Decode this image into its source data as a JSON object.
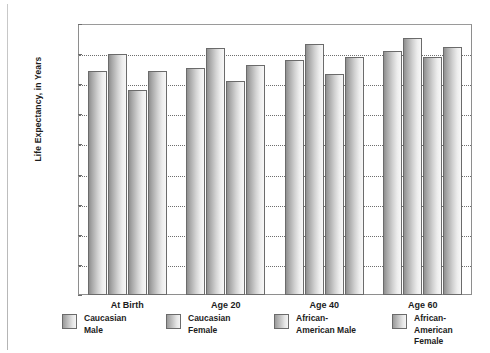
{
  "chart_data": {
    "type": "bar",
    "title": "",
    "xlabel": "",
    "ylabel": "Life Expectancy, in Years",
    "ylim": [
      0,
      90
    ],
    "yticks": [
      0,
      10,
      20,
      30,
      40,
      50,
      60,
      70,
      80,
      90
    ],
    "grid": true,
    "legend_position": "bottom",
    "categories": [
      "At Birth",
      "Age 20",
      "Age 40",
      "Age 60"
    ],
    "series": [
      {
        "name": "Caucasian Male",
        "values": [
          74.5,
          75.5,
          78.0,
          81.0
        ]
      },
      {
        "name": "Caucasian Female",
        "values": [
          80.0,
          82.0,
          83.5,
          85.5
        ]
      },
      {
        "name": "African-American Male",
        "values": [
          68.0,
          71.0,
          73.5,
          79.0
        ]
      },
      {
        "name": "African-American Female",
        "values": [
          74.5,
          76.5,
          79.0,
          82.5
        ]
      }
    ],
    "legend": [
      "Caucasian\nMale",
      "Caucasian\nFemale",
      "African-\nAmerican Male",
      "African-\nAmerican Female"
    ],
    "colors": {
      "bar_gradient_dark": "#8f8f8f",
      "bar_gradient_light": "#f7f7f7",
      "bar_outline": "#6b6b6b",
      "gridline": "#6e6e6e",
      "axis": "#8e8e8e",
      "text": "#1c1c1c",
      "background": "#ffffff"
    }
  }
}
